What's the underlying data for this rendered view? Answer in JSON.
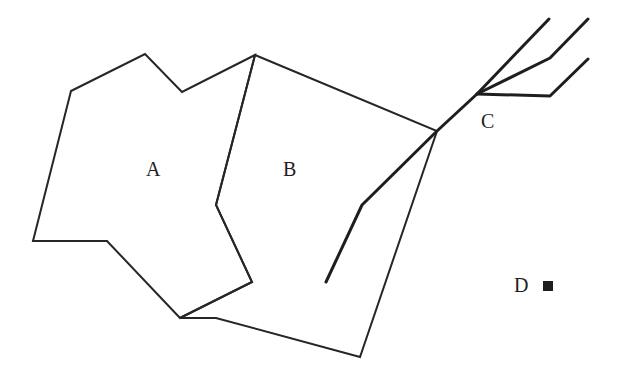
{
  "diagram": {
    "type": "map-schematic",
    "regions": [
      {
        "id": "A",
        "label": "A",
        "label_pos": [
          146,
          176
        ],
        "points": "71,91 145,54 182,92 255,55 216,205 252,282 180,318 107,241 33,241"
      },
      {
        "id": "B",
        "label": "B",
        "label_pos": [
          283,
          176
        ],
        "points": "255,55 437,131 360,357 216,318 180,318 252,282 216,205"
      }
    ],
    "river": {
      "id": "C",
      "label": "C",
      "label_pos": [
        481,
        128
      ],
      "trunk": "326,282 362,205 437,131 477,94 549,19",
      "branch_upper": "477,94 550,58 588,19",
      "branch_lower": "477,94 550,96 588,59"
    },
    "point": {
      "id": "D",
      "label": "D",
      "label_pos": [
        514,
        292
      ],
      "marker": {
        "x": 543,
        "y": 281,
        "size": 10
      }
    },
    "colors": {
      "line": "#262626",
      "text": "#1e1e1e",
      "background": "#ffffff"
    }
  }
}
